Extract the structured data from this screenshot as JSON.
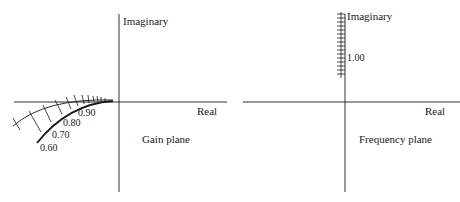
{
  "gain_plane": {
    "title": "Gain plane",
    "imag_axis_label": "Imaginary",
    "real_axis_label": "Real",
    "locus_labels": [
      "0.90",
      "0.80",
      "0.70",
      "0.60"
    ]
  },
  "frequency_plane": {
    "title": "Frequency plane",
    "imag_axis_label": "Imaginary",
    "real_axis_label": "Real",
    "tick_label": "1.00"
  },
  "colors": {
    "ink": "#1a1a1a",
    "background": "#ffffff"
  }
}
